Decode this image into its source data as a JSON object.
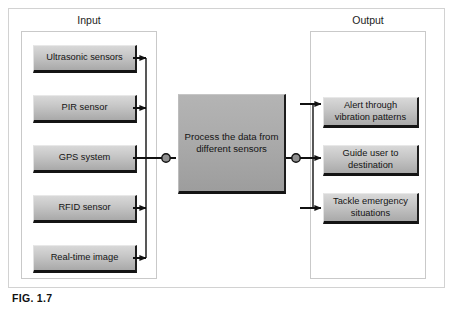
{
  "figure": {
    "caption": "FIG. 1.7"
  },
  "groups": {
    "input": {
      "title": "Input"
    },
    "output": {
      "title": "Output"
    }
  },
  "nodes": {
    "inputs": [
      {
        "id": "ultrasonic",
        "label": "Ultrasonic sensors"
      },
      {
        "id": "pir",
        "label": "PIR sensor"
      },
      {
        "id": "gps",
        "label": "GPS system"
      },
      {
        "id": "rfid",
        "label": "RFID sensor"
      },
      {
        "id": "realtime",
        "label": "Real-time image"
      }
    ],
    "process": {
      "id": "process",
      "label": "Process the data from different sensors"
    },
    "outputs": [
      {
        "id": "alert",
        "label": "Alert through vibration patterns"
      },
      {
        "id": "guide",
        "label": "Guide user to destination"
      },
      {
        "id": "tackle",
        "label": "Tackle emergency situations"
      }
    ]
  },
  "colors": {
    "node_face": "#c8c8c8",
    "process_face": "#ababab",
    "node_shadow": "#141414",
    "panel_border": "#c9c9c9",
    "frame_border": "#d2d2d2",
    "wire": "#111111",
    "text": "#141414"
  },
  "connections": {
    "input_bus_label": "inputs merge to process",
    "output_bus_label": "process fans out to outputs"
  }
}
